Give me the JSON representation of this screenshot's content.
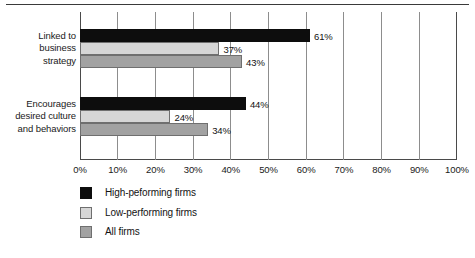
{
  "figure": {
    "clipped_header_text": "",
    "background_color": "#ffffff"
  },
  "chart_data": {
    "type": "bar",
    "orientation": "horizontal",
    "title": "",
    "xlabel": "",
    "ylabel": "",
    "xlim": [
      0,
      100
    ],
    "grid": true,
    "grid_axis": "x",
    "legend_position": "bottom-left",
    "categories": [
      "Linked to business strategy",
      "Encourages desired culture and behaviors"
    ],
    "category_label_lines": [
      [
        "Linked to",
        "business",
        "strategy"
      ],
      [
        "Encourages",
        "desired culture",
        "and behaviors"
      ]
    ],
    "series": [
      {
        "name": "High-peforming firms",
        "color": "#0d0d0d",
        "values": [
          61,
          44
        ],
        "value_labels": [
          "61%",
          "44%"
        ]
      },
      {
        "name": "Low-performing firms",
        "color": "#d6d6d6",
        "values": [
          37,
          24
        ],
        "value_labels": [
          "37%",
          "24%"
        ]
      },
      {
        "name": "All firms",
        "color": "#a2a2a2",
        "values": [
          43,
          34
        ],
        "value_labels": [
          "43%",
          "34%"
        ]
      }
    ],
    "xticks": [
      0,
      10,
      20,
      30,
      40,
      50,
      60,
      70,
      80,
      90,
      100
    ],
    "xtick_labels": [
      "0%",
      "10%",
      "20%",
      "30%",
      "40%",
      "50%",
      "60%",
      "70%",
      "80%",
      "90%",
      "100%"
    ]
  },
  "legend": {
    "items": [
      {
        "label": "High-peforming firms",
        "swatch": "black-swatch"
      },
      {
        "label": "Low-performing firms",
        "swatch": "light-gray-swatch"
      },
      {
        "label": "All firms",
        "swatch": "medium-gray-swatch"
      }
    ]
  }
}
